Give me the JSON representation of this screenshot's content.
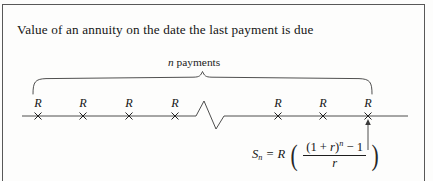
{
  "figure": {
    "caption": "Value of an annuity on the date the last payment is due",
    "brace_label_italic": "n",
    "brace_label_rest": " payments",
    "timeline": {
      "payment_symbol": "R",
      "payment_count_visible": 7,
      "tick_symbol": "×",
      "has_break": true,
      "break_style": "zigzag",
      "tick_positions_px": [
        38,
        83,
        129,
        175,
        278,
        323,
        368
      ],
      "axis_y_px": 116,
      "axis_start_px": 22,
      "axis_end_px": 408,
      "labels": [
        "R",
        "R",
        "R",
        "R",
        "R",
        "R",
        "R"
      ]
    },
    "brace": {
      "start_px": 33,
      "end_px": 372,
      "top_y_px": 78,
      "bottom_y_px": 94
    },
    "arrow": {
      "from_y_px": 148,
      "to_y_px": 118,
      "x_px": 368,
      "points_to": "last-payment-tick"
    },
    "formula": {
      "lhs_symbol": "S",
      "lhs_subscript": "n",
      "equals": "=",
      "factor": "R",
      "open_paren": "(",
      "close_paren": ")",
      "numerator_base_open": "(1 + ",
      "numerator_rate": "r",
      "numerator_base_close": ")",
      "numerator_exponent": "n",
      "numerator_minus": " − 1",
      "denominator": "r",
      "plain_text": "S_n = R ( ((1 + r)^n - 1) / r )"
    },
    "colors": {
      "ink": "#151515",
      "rule": "#585858",
      "background": "#fdfdfc"
    }
  }
}
